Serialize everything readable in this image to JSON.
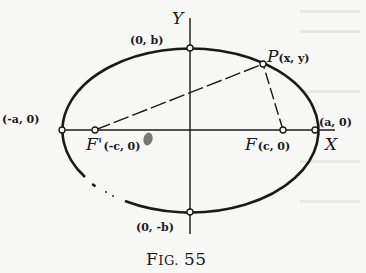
{
  "figure": {
    "caption": "FIG. 55",
    "caption_prefix": "F",
    "caption_smallcaps": "IG.",
    "caption_number": "55",
    "axes": {
      "x_label": "X",
      "y_label": "Y",
      "origin_label": "O"
    },
    "points": {
      "vertex_right": "(a, 0)",
      "vertex_left": "(-a, 0)",
      "covertex_top": "(0, b)",
      "covertex_bottom": "(0, -b)",
      "focus_right_name": "F",
      "focus_right_coords": "(c, 0)",
      "focus_left_name": "F'",
      "focus_left_coords": "(-c, 0)",
      "point_name": "P",
      "point_coords": "(x, y)"
    },
    "shape": "ellipse",
    "colors": {
      "ink": "#1a1a1a",
      "paper": "#f7f7f5",
      "origin_mark": "#777777"
    }
  }
}
